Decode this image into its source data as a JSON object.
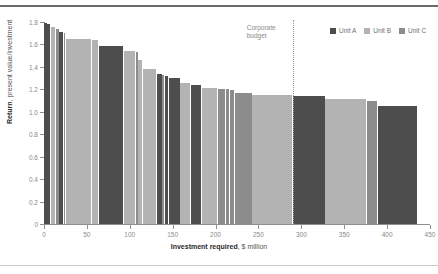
{
  "chart_data": {
    "type": "bar",
    "title": "",
    "subtitle": "",
    "xlabel_strong": "Investment required",
    "xlabel_rest": ", $ million",
    "ylabel_strong": "Return",
    "ylabel_rest": ", present value/investment",
    "xlim": [
      0,
      450
    ],
    "ylim": [
      0,
      1.8
    ],
    "xticks": [
      0,
      50,
      100,
      150,
      200,
      250,
      300,
      350,
      400,
      450
    ],
    "xtick_labels": [
      "0",
      "50",
      "100",
      "150",
      "200",
      "250",
      "300",
      "350",
      "400",
      "450"
    ],
    "yticks": [
      0,
      0.2,
      0.4,
      0.6,
      0.8,
      1.0,
      1.2,
      1.4,
      1.6,
      1.8
    ],
    "ytick_labels": [
      "0",
      "0.2",
      "0.4",
      "0.6",
      "0.8",
      "1.0",
      "1.2",
      "1.4",
      "1.6",
      "1.8"
    ],
    "grid": false,
    "variable_width": true,
    "x_unit": "$ million investment",
    "y_unit": "present value / investment",
    "annotations": [
      {
        "name": "corporate-budget",
        "label_line1": "Corporate",
        "label_line2": "budget",
        "x_value": 290,
        "style": "dotted-vertical-line"
      }
    ],
    "series_colors": {
      "Unit A": "#4d4d4d",
      "Unit B": "#b3b3b3",
      "Unit C": "#8c8c8c"
    },
    "legend": {
      "position": "top-right",
      "entries": [
        {
          "label": "Unit A",
          "color": "#4d4d4d"
        },
        {
          "label": "Unit B",
          "color": "#b3b3b3"
        },
        {
          "label": "Unit C",
          "color": "#8c8c8c"
        }
      ]
    },
    "bars": [
      {
        "unit": "Unit A",
        "x_start": 0,
        "width": 4,
        "value": 1.79
      },
      {
        "unit": "Unit A",
        "x_start": 4,
        "width": 4,
        "value": 1.78
      },
      {
        "unit": "Unit B",
        "x_start": 8,
        "width": 6,
        "value": 1.76
      },
      {
        "unit": "Unit C",
        "x_start": 14,
        "width": 4,
        "value": 1.74
      },
      {
        "unit": "Unit A",
        "x_start": 18,
        "width": 5,
        "value": 1.71
      },
      {
        "unit": "Unit C",
        "x_start": 23,
        "width": 3,
        "value": 1.7
      },
      {
        "unit": "Unit B",
        "x_start": 26,
        "width": 30,
        "value": 1.65
      },
      {
        "unit": "Unit B",
        "x_start": 56,
        "width": 8,
        "value": 1.64
      },
      {
        "unit": "Unit A",
        "x_start": 64,
        "width": 29,
        "value": 1.59
      },
      {
        "unit": "Unit B",
        "x_start": 93,
        "width": 14,
        "value": 1.54
      },
      {
        "unit": "Unit C",
        "x_start": 107,
        "width": 3,
        "value": 1.53
      },
      {
        "unit": "Unit B",
        "x_start": 110,
        "width": 5,
        "value": 1.46
      },
      {
        "unit": "Unit B",
        "x_start": 115,
        "width": 17,
        "value": 1.38
      },
      {
        "unit": "Unit A",
        "x_start": 132,
        "width": 6,
        "value": 1.34
      },
      {
        "unit": "Unit C",
        "x_start": 138,
        "width": 3,
        "value": 1.33
      },
      {
        "unit": "Unit A",
        "x_start": 141,
        "width": 5,
        "value": 1.32
      },
      {
        "unit": "Unit A",
        "x_start": 146,
        "width": 13,
        "value": 1.3
      },
      {
        "unit": "Unit B",
        "x_start": 159,
        "width": 12,
        "value": 1.26
      },
      {
        "unit": "Unit A",
        "x_start": 171,
        "width": 13,
        "value": 1.24
      },
      {
        "unit": "Unit B",
        "x_start": 184,
        "width": 19,
        "value": 1.21
      },
      {
        "unit": "Unit C",
        "x_start": 203,
        "width": 9,
        "value": 1.205
      },
      {
        "unit": "Unit C",
        "x_start": 212,
        "width": 5,
        "value": 1.2
      },
      {
        "unit": "Unit C",
        "x_start": 217,
        "width": 6,
        "value": 1.19
      },
      {
        "unit": "Unit C",
        "x_start": 223,
        "width": 20,
        "value": 1.17
      },
      {
        "unit": "Unit B",
        "x_start": 243,
        "width": 47,
        "value": 1.15
      },
      {
        "unit": "Unit A",
        "x_start": 290,
        "width": 38,
        "value": 1.14
      },
      {
        "unit": "Unit B",
        "x_start": 328,
        "width": 48,
        "value": 1.11
      },
      {
        "unit": "Unit C",
        "x_start": 376,
        "width": 13,
        "value": 1.1
      },
      {
        "unit": "Unit A",
        "x_start": 389,
        "width": 47,
        "value": 1.05
      }
    ]
  }
}
